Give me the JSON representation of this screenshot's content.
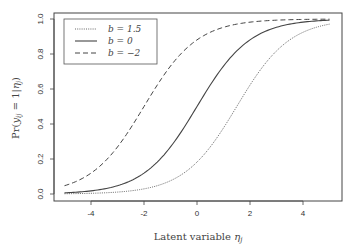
{
  "chart_data": {
    "type": "line",
    "title": "",
    "xlabel": "Latent variable η_j",
    "ylabel": "Pr(y_ij = 1|η_j)",
    "xlim": [
      -5,
      5
    ],
    "ylim": [
      0,
      1
    ],
    "grid": false,
    "legend_position": "top-left",
    "x_ticks": [
      -4,
      -2,
      0,
      2,
      4
    ],
    "x_tick_labels": [
      "-4",
      "-2",
      "0",
      "2",
      "4"
    ],
    "y_ticks": [
      0.0,
      0.2,
      0.4,
      0.6,
      0.8,
      1.0
    ],
    "y_tick_labels": [
      "0.0",
      "0.2",
      "0.4",
      "0.6",
      "0.8",
      "1.0"
    ],
    "x": [
      -5,
      -4,
      -3,
      -2,
      -1,
      0,
      1,
      2,
      3,
      4,
      5
    ],
    "series": [
      {
        "name": "b=1.5",
        "b": 1.5,
        "style": "dotted",
        "values": [
          0.0015,
          0.0041,
          0.011,
          0.0293,
          0.0759,
          0.1824,
          0.3775,
          0.6225,
          0.8176,
          0.9241,
          0.9707
        ]
      },
      {
        "name": "b=0",
        "b": 0,
        "style": "solid",
        "values": [
          0.0067,
          0.018,
          0.0474,
          0.1192,
          0.2689,
          0.5,
          0.7311,
          0.8808,
          0.9526,
          0.982,
          0.9933
        ]
      },
      {
        "name": "b=−2",
        "b": -2,
        "style": "dashed",
        "values": [
          0.0474,
          0.1192,
          0.2689,
          0.5,
          0.7311,
          0.8808,
          0.9526,
          0.982,
          0.9933,
          0.9975,
          0.9991
        ]
      }
    ]
  },
  "legend": {
    "items": [
      "b = 1.5",
      "b = 0",
      "b = −2"
    ]
  },
  "axes": {
    "xlabel_main": "Latent variable ",
    "xlabel_symbol": "η",
    "xlabel_sub": "j",
    "ylabel_main": "Pr(",
    "ylabel_y": "y",
    "ylabel_sub_ij": "ij",
    "ylabel_mid": " = 1|",
    "ylabel_eta": "η",
    "ylabel_sub_j": "j",
    "ylabel_close": ")"
  }
}
